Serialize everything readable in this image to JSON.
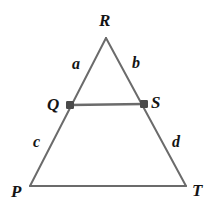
{
  "figure": {
    "type": "geometry-diagram",
    "canvas": {
      "width": 210,
      "height": 211,
      "background": "#ffffff"
    },
    "stroke_color": "#6b6b6b",
    "point_color": "#4a4a4a",
    "label_color": "#141414",
    "vertices": [
      {
        "id": "R",
        "label": "R",
        "x": 106,
        "y": 38,
        "marker": false
      },
      {
        "id": "Q",
        "label": "Q",
        "x": 70,
        "y": 105,
        "marker": true
      },
      {
        "id": "S",
        "label": "S",
        "x": 144,
        "y": 104,
        "marker": true
      },
      {
        "id": "P",
        "label": "P",
        "x": 30,
        "y": 186,
        "marker": false
      },
      {
        "id": "T",
        "label": "T",
        "x": 186,
        "y": 186,
        "marker": false
      }
    ],
    "segments": [
      {
        "id": "RP",
        "from": "R",
        "to": "P",
        "label": null
      },
      {
        "id": "RT",
        "from": "R",
        "to": "T",
        "label": null
      },
      {
        "id": "PT",
        "from": "P",
        "to": "T",
        "label": null
      },
      {
        "id": "QS",
        "from": "Q",
        "to": "S",
        "label": null
      }
    ],
    "side_labels": [
      {
        "id": "a",
        "label": "a",
        "describes": "RQ",
        "x": 77,
        "y": 65
      },
      {
        "id": "b",
        "label": "b",
        "describes": "RS",
        "x": 137,
        "y": 64
      },
      {
        "id": "c",
        "label": "c",
        "describes": "QP",
        "x": 38,
        "y": 143
      },
      {
        "id": "d",
        "label": "d",
        "describes": "ST",
        "x": 177,
        "y": 143
      }
    ]
  }
}
